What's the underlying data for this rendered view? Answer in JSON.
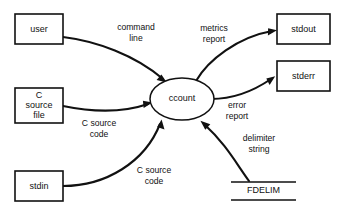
{
  "diagram": {
    "type": "data-flow-diagram",
    "background_color": "#ffffff",
    "stroke_color": "#111111",
    "nodes": [
      {
        "id": "user",
        "label": "user",
        "shape": "rectangle"
      },
      {
        "id": "c-source-file",
        "label": "C\nsource\nfile",
        "line1": "C",
        "line2": "source",
        "line3": "file",
        "shape": "rectangle"
      },
      {
        "id": "stdin",
        "label": "stdin",
        "shape": "rectangle"
      },
      {
        "id": "ccount",
        "label": "ccount",
        "shape": "ellipse"
      },
      {
        "id": "stdout",
        "label": "stdout",
        "shape": "rectangle"
      },
      {
        "id": "stderr",
        "label": "stderr",
        "shape": "rectangle"
      },
      {
        "id": "fdelim",
        "label": "FDELIM",
        "shape": "data-store"
      }
    ],
    "flows": [
      {
        "id": "command-line",
        "line1": "command",
        "line2": "line",
        "from": "user",
        "to": "ccount"
      },
      {
        "id": "c-source-code-file",
        "line1": "C source",
        "line2": "code",
        "from": "c-source-file",
        "to": "ccount"
      },
      {
        "id": "c-source-code-stdin",
        "line1": "C source",
        "line2": "code",
        "from": "stdin",
        "to": "ccount"
      },
      {
        "id": "metrics-report",
        "line1": "metrics",
        "line2": "report",
        "from": "ccount",
        "to": "stdout"
      },
      {
        "id": "error-report",
        "line1": "error",
        "line2": "report",
        "from": "ccount",
        "to": "stderr"
      },
      {
        "id": "delimiter-string",
        "line1": "delimiter",
        "line2": "string",
        "from": "fdelim",
        "to": "ccount"
      }
    ]
  }
}
